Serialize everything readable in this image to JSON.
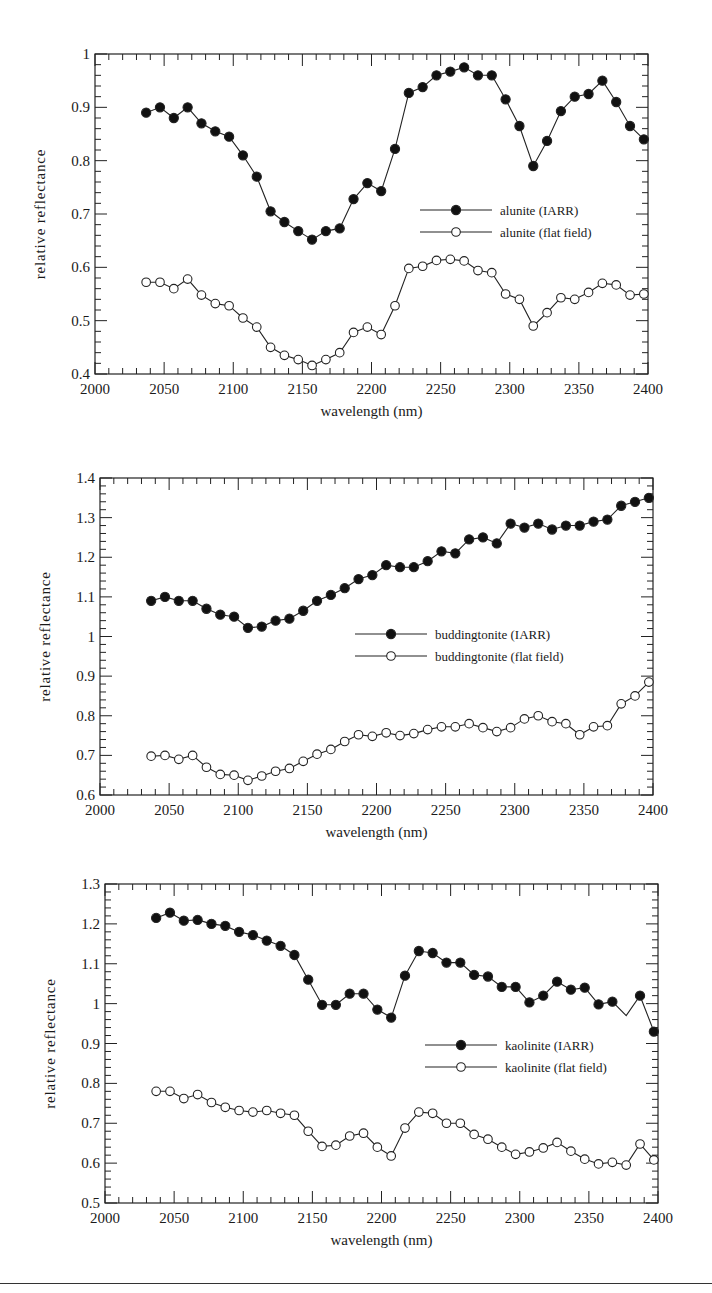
{
  "chart_data": [
    {
      "type": "line",
      "title": "",
      "xlabel": "wavelength (nm)",
      "ylabel": "relative reflectance",
      "xlim": [
        2000,
        2400
      ],
      "ylim": [
        0.4,
        1.0
      ],
      "xticks": [
        "2000",
        "2050",
        "2100",
        "2150",
        "2200",
        "2250",
        "2300",
        "2350",
        "2400"
      ],
      "yticks": [
        "0.4",
        "0.5",
        "0.6",
        "0.7",
        "0.8",
        "0.9",
        "1"
      ],
      "grid": false,
      "legend_position": "center-right",
      "x": [
        2037,
        2047,
        2057,
        2067,
        2077,
        2087,
        2097,
        2107,
        2117,
        2127,
        2137,
        2147,
        2157,
        2167,
        2177,
        2187,
        2197,
        2207,
        2217,
        2227,
        2237,
        2247,
        2257,
        2267,
        2277,
        2287,
        2297,
        2307,
        2317,
        2327,
        2337,
        2347,
        2357,
        2367,
        2377,
        2387,
        2397
      ],
      "series": [
        {
          "name": "alunite (IARR)",
          "marker": "filled-circle",
          "values": [
            0.89,
            0.9,
            0.88,
            0.9,
            0.87,
            0.855,
            0.845,
            0.81,
            0.77,
            0.705,
            0.685,
            0.668,
            0.652,
            0.668,
            0.673,
            0.728,
            0.758,
            0.743,
            0.822,
            0.927,
            0.938,
            0.96,
            0.967,
            0.975,
            0.96,
            0.96,
            0.915,
            0.865,
            0.79,
            0.837,
            0.893,
            0.92,
            0.925,
            0.95,
            0.91,
            0.865,
            0.84
          ]
        },
        {
          "name": "alunite (flat field)",
          "marker": "open-circle",
          "values": [
            0.572,
            0.572,
            0.56,
            0.578,
            0.548,
            0.532,
            0.528,
            0.505,
            0.488,
            0.45,
            0.435,
            0.427,
            0.416,
            0.427,
            0.44,
            0.478,
            0.488,
            0.474,
            0.528,
            0.598,
            0.602,
            0.613,
            0.615,
            0.612,
            0.594,
            0.59,
            0.55,
            0.54,
            0.49,
            0.515,
            0.543,
            0.54,
            0.553,
            0.57,
            0.567,
            0.548,
            0.55
          ]
        }
      ],
      "layout": {
        "top": 0,
        "height": 420,
        "frame": [
          95,
          54,
          648,
          374
        ],
        "legend_x": 420,
        "legend_y": 210
      }
    },
    {
      "type": "line",
      "title": "",
      "xlabel": "wavelength (nm)",
      "ylabel": "relative reflectance",
      "xlim": [
        2000,
        2400
      ],
      "ylim": [
        0.6,
        1.4
      ],
      "xticks": [
        "2000",
        "2050",
        "2100",
        "2150",
        "2200",
        "2250",
        "2300",
        "2350",
        "2400"
      ],
      "yticks": [
        "0.6",
        "0.7",
        "0.8",
        "0.9",
        "1",
        "1.1",
        "1.2",
        "1.3",
        "1.4"
      ],
      "grid": false,
      "legend_position": "center-right",
      "x": [
        2037,
        2047,
        2057,
        2067,
        2077,
        2087,
        2097,
        2107,
        2117,
        2127,
        2137,
        2147,
        2157,
        2167,
        2177,
        2187,
        2197,
        2207,
        2217,
        2227,
        2237,
        2247,
        2257,
        2267,
        2277,
        2287,
        2297,
        2307,
        2317,
        2327,
        2337,
        2347,
        2357,
        2367,
        2377,
        2387,
        2397
      ],
      "series": [
        {
          "name": "buddingtonite (IARR)",
          "marker": "filled-circle",
          "values": [
            1.09,
            1.1,
            1.09,
            1.09,
            1.07,
            1.055,
            1.05,
            1.022,
            1.025,
            1.04,
            1.045,
            1.065,
            1.09,
            1.105,
            1.122,
            1.145,
            1.155,
            1.18,
            1.175,
            1.175,
            1.19,
            1.215,
            1.21,
            1.245,
            1.25,
            1.235,
            1.285,
            1.275,
            1.285,
            1.27,
            1.28,
            1.28,
            1.29,
            1.295,
            1.33,
            1.34,
            1.35
          ]
        },
        {
          "name": "buddingtonite (flat field)",
          "marker": "open-circle",
          "values": [
            0.698,
            0.7,
            0.69,
            0.7,
            0.67,
            0.652,
            0.65,
            0.637,
            0.648,
            0.66,
            0.667,
            0.685,
            0.703,
            0.715,
            0.735,
            0.752,
            0.748,
            0.757,
            0.75,
            0.755,
            0.765,
            0.772,
            0.772,
            0.78,
            0.77,
            0.76,
            0.77,
            0.792,
            0.8,
            0.785,
            0.78,
            0.752,
            0.772,
            0.775,
            0.83,
            0.85,
            0.885
          ]
        }
      ],
      "layout": {
        "top": 420,
        "height": 440,
        "frame": [
          100,
          58,
          653,
          375
        ],
        "legend_x": 355,
        "legend_y": 214
      }
    },
    {
      "type": "line",
      "title": "",
      "xlabel": "wavelength (nm)",
      "ylabel": "relative reflectance",
      "xlim": [
        2000,
        2400
      ],
      "ylim": [
        0.5,
        1.3
      ],
      "xticks": [
        "2000",
        "2050",
        "2100",
        "2150",
        "2200",
        "2250",
        "2300",
        "2350",
        "2400"
      ],
      "yticks": [
        "0.5",
        "0.6",
        "0.7",
        "0.8",
        "0.9",
        "1",
        "1.1",
        "1.2",
        "1.3"
      ],
      "grid": false,
      "legend_position": "center-right",
      "x": [
        2037,
        2047,
        2057,
        2067,
        2077,
        2087,
        2097,
        2107,
        2117,
        2127,
        2137,
        2147,
        2157,
        2167,
        2177,
        2187,
        2197,
        2207,
        2217,
        2227,
        2237,
        2247,
        2257,
        2267,
        2277,
        2287,
        2297,
        2307,
        2317,
        2327,
        2337,
        2347,
        2357,
        2367,
        2377,
        2387,
        2397
      ],
      "series": [
        {
          "name": "kaolinite (IARR)",
          "marker": "filled-circle",
          "values": [
            1.215,
            1.228,
            1.208,
            1.21,
            1.2,
            1.195,
            1.18,
            1.172,
            1.158,
            1.145,
            1.122,
            1.06,
            0.997,
            0.997,
            1.025,
            1.025,
            0.985,
            0.965,
            1.07,
            1.132,
            1.127,
            1.103,
            1.103,
            1.072,
            1.068,
            1.042,
            1.042,
            1.003,
            1.02,
            1.055,
            1.035,
            1.04,
            0.998,
            1.005,
            0.97,
            1.02,
            0.93
          ],
          "missing_markers": [
            34
          ]
        },
        {
          "name": "kaolinite (flat field)",
          "marker": "open-circle",
          "values": [
            0.78,
            0.78,
            0.762,
            0.772,
            0.752,
            0.74,
            0.732,
            0.728,
            0.732,
            0.725,
            0.72,
            0.68,
            0.642,
            0.645,
            0.668,
            0.675,
            0.64,
            0.618,
            0.688,
            0.728,
            0.725,
            0.7,
            0.7,
            0.672,
            0.66,
            0.64,
            0.622,
            0.628,
            0.638,
            0.652,
            0.63,
            0.61,
            0.598,
            0.602,
            0.595,
            0.648,
            0.608
          ]
        }
      ],
      "layout": {
        "top": 860,
        "height": 423,
        "frame": [
          105,
          24,
          658,
          343
        ],
        "legend_x": 425,
        "legend_y": 185
      }
    }
  ]
}
